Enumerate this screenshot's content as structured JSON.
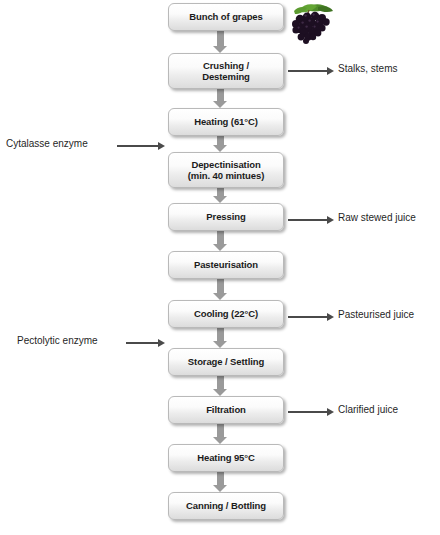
{
  "diagram": {
    "background": "#ffffff",
    "box_fill_top": "#ffffff",
    "box_fill_bottom": "#dcdcdc",
    "box_border": "#b9b9b9",
    "connector_color": "#9a9a9a",
    "arrow_color": "#4a4a4a",
    "text_color": "#1b1b1b"
  },
  "steps": [
    {
      "id": "bunch-of-grapes",
      "label": "Bunch of grapes",
      "line2": "",
      "top": 3,
      "height": 28
    },
    {
      "id": "crushing-destemming",
      "label": "Crushing /",
      "line2": "Desteming",
      "top": 53,
      "height": 36
    },
    {
      "id": "heating-61",
      "label": "Heating (61°C)",
      "line2": "",
      "top": 108,
      "height": 28
    },
    {
      "id": "depectinisation",
      "label": "Depectinisation",
      "line2": "(min. 40 mintues)",
      "top": 152,
      "height": 36
    },
    {
      "id": "pressing",
      "label": "Pressing",
      "line2": "",
      "top": 203,
      "height": 28
    },
    {
      "id": "pasteurisation",
      "label": "Pasteurisation",
      "line2": "",
      "top": 251,
      "height": 28
    },
    {
      "id": "cooling-22",
      "label": "Cooling (22°C)",
      "line2": "",
      "top": 300,
      "height": 28
    },
    {
      "id": "storage-settling",
      "label": "Storage / Settling",
      "line2": "",
      "top": 348,
      "height": 28
    },
    {
      "id": "filtration",
      "label": "Filtration",
      "line2": "",
      "top": 396,
      "height": 28
    },
    {
      "id": "heating-95",
      "label": "Heating 95°C",
      "line2": "",
      "top": 444,
      "height": 28
    },
    {
      "id": "canning-bottling",
      "label": "Canning / Bottling",
      "line2": "",
      "top": 492,
      "height": 28
    }
  ],
  "outputs": [
    {
      "id": "stalks-stems",
      "label": "Stalks, stems",
      "text_left": 338,
      "text_top": 63,
      "arrow_left": 288,
      "arrow_top": 66,
      "arrow_width": 46
    },
    {
      "id": "raw-stewed-juice",
      "label": "Raw stewed juice",
      "text_left": 338,
      "text_top": 212,
      "arrow_left": 288,
      "arrow_top": 215,
      "arrow_width": 46
    },
    {
      "id": "pasteurised-juice",
      "label": "Pasteurised juice",
      "text_left": 338,
      "text_top": 309,
      "arrow_left": 288,
      "arrow_top": 312,
      "arrow_width": 46
    },
    {
      "id": "clarified-juice",
      "label": "Clarified juice",
      "text_left": 338,
      "text_top": 404,
      "arrow_left": 288,
      "arrow_top": 407,
      "arrow_width": 46
    }
  ],
  "inputs": [
    {
      "id": "cytalasse-enzyme",
      "label": "Cytalasse enzyme",
      "text_left": 6,
      "text_top": 138,
      "arrow_left": 117,
      "arrow_top": 141,
      "arrow_width": 48
    },
    {
      "id": "pectolytic-enzyme",
      "label": "Pectolytic enzyme",
      "text_left": 17,
      "text_top": 335,
      "arrow_left": 126,
      "arrow_top": 338,
      "arrow_width": 39
    }
  ],
  "connectors": [
    {
      "id": "conn-1",
      "top": 31,
      "height": 22
    },
    {
      "id": "conn-2",
      "top": 89,
      "height": 19
    },
    {
      "id": "conn-3",
      "top": 136,
      "height": 16
    },
    {
      "id": "conn-4",
      "top": 188,
      "height": 15
    },
    {
      "id": "conn-5",
      "top": 231,
      "height": 20
    },
    {
      "id": "conn-6",
      "top": 279,
      "height": 21
    },
    {
      "id": "conn-7",
      "top": 328,
      "height": 20
    },
    {
      "id": "conn-8",
      "top": 376,
      "height": 20
    },
    {
      "id": "conn-9",
      "top": 424,
      "height": 20
    },
    {
      "id": "conn-10",
      "top": 472,
      "height": 20
    }
  ],
  "decoration": {
    "grapes_icon": "grape-cluster-icon",
    "grape_berry_color": "#1d0f22",
    "grape_leaf_color": "#4f8b2a"
  }
}
